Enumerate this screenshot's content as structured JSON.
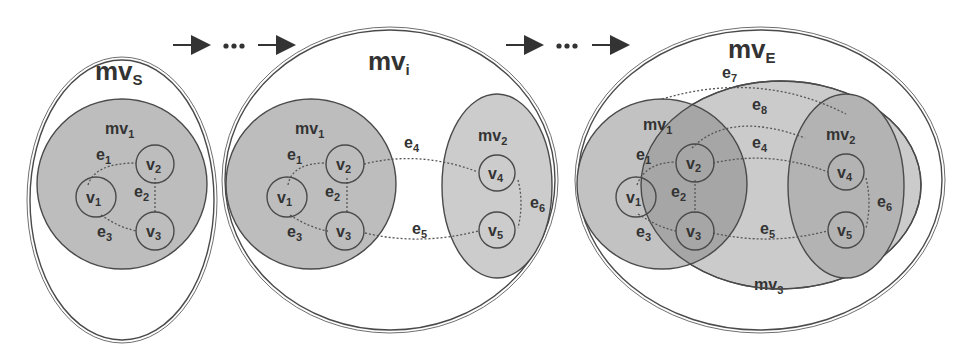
{
  "figure": {
    "type": "hypergraph-merging-sequence",
    "colors": {
      "background": "#ffffff",
      "stroke": "#4a4a4a",
      "mv_fill_dark": "#b4b4b4",
      "mv_fill_light": "#c8c8c8",
      "mv_fill_overlap": "#a0a0a0",
      "vertex_fill": "none"
    },
    "flow": {
      "arrow": "→",
      "ellipsis": "•••"
    },
    "panels": [
      {
        "id": "mvS",
        "title_main": "mv",
        "title_sub": "S",
        "inner": [
          {
            "id": "mv1",
            "main": "mv",
            "sub": "1"
          }
        ],
        "vertices": [
          {
            "id": "v1",
            "main": "v",
            "sub": "1"
          },
          {
            "id": "v2",
            "main": "v",
            "sub": "2"
          },
          {
            "id": "v3",
            "main": "v",
            "sub": "3"
          }
        ],
        "edges": [
          {
            "id": "e1",
            "main": "e",
            "sub": "1"
          },
          {
            "id": "e2",
            "main": "e",
            "sub": "2"
          },
          {
            "id": "e3",
            "main": "e",
            "sub": "3"
          }
        ]
      },
      {
        "id": "mvi",
        "title_main": "mv",
        "title_sub": "i",
        "inner": [
          {
            "id": "mv1",
            "main": "mv",
            "sub": "1"
          },
          {
            "id": "mv2",
            "main": "mv",
            "sub": "2"
          }
        ],
        "vertices": [
          {
            "id": "v1",
            "main": "v",
            "sub": "1"
          },
          {
            "id": "v2",
            "main": "v",
            "sub": "2"
          },
          {
            "id": "v3",
            "main": "v",
            "sub": "3"
          },
          {
            "id": "v4",
            "main": "v",
            "sub": "4"
          },
          {
            "id": "v5",
            "main": "v",
            "sub": "5"
          }
        ],
        "edges": [
          {
            "id": "e1",
            "main": "e",
            "sub": "1"
          },
          {
            "id": "e2",
            "main": "e",
            "sub": "2"
          },
          {
            "id": "e3",
            "main": "e",
            "sub": "3"
          },
          {
            "id": "e4",
            "main": "e",
            "sub": "4"
          },
          {
            "id": "e5",
            "main": "e",
            "sub": "5"
          },
          {
            "id": "e6",
            "main": "e",
            "sub": "6"
          }
        ]
      },
      {
        "id": "mvE",
        "title_main": "mv",
        "title_sub": "E",
        "inner": [
          {
            "id": "mv1",
            "main": "mv",
            "sub": "1"
          },
          {
            "id": "mv2",
            "main": "mv",
            "sub": "2"
          },
          {
            "id": "mv3",
            "main": "mv",
            "sub": "3"
          }
        ],
        "vertices": [
          {
            "id": "v1",
            "main": "v",
            "sub": "1"
          },
          {
            "id": "v2",
            "main": "v",
            "sub": "2"
          },
          {
            "id": "v3",
            "main": "v",
            "sub": "3"
          },
          {
            "id": "v4",
            "main": "v",
            "sub": "4"
          },
          {
            "id": "v5",
            "main": "v",
            "sub": "5"
          }
        ],
        "edges": [
          {
            "id": "e1",
            "main": "e",
            "sub": "1"
          },
          {
            "id": "e2",
            "main": "e",
            "sub": "2"
          },
          {
            "id": "e3",
            "main": "e",
            "sub": "3"
          },
          {
            "id": "e4",
            "main": "e",
            "sub": "4"
          },
          {
            "id": "e5",
            "main": "e",
            "sub": "5"
          },
          {
            "id": "e6",
            "main": "e",
            "sub": "6"
          },
          {
            "id": "e7",
            "main": "e",
            "sub": "7"
          },
          {
            "id": "e8",
            "main": "e",
            "sub": "8"
          }
        ]
      }
    ]
  }
}
